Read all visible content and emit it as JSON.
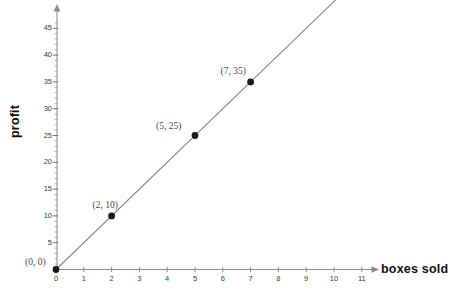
{
  "chart_data": {
    "type": "line",
    "title": "",
    "xlabel": "boxes sold",
    "ylabel": "profit",
    "xlim": [
      0,
      11.8
    ],
    "ylim": [
      0,
      46.5
    ],
    "grid": false,
    "legend": null,
    "x_ticks": [
      "0",
      "1",
      "2",
      "3",
      "4",
      "5",
      "6",
      "7",
      "8",
      "9",
      "10",
      "11"
    ],
    "x_tick_values": [
      0,
      1,
      2,
      3,
      4,
      5,
      6,
      7,
      8,
      9,
      10,
      11
    ],
    "y_ticks": [
      "5",
      "10",
      "15",
      "20",
      "25",
      "30",
      "35",
      "40",
      "45"
    ],
    "y_tick_values": [
      5,
      10,
      15,
      20,
      25,
      30,
      35,
      40,
      45
    ],
    "y_minor_step": 1,
    "series": [
      {
        "name": "profit line",
        "color": "#8a8a8a",
        "x": [
          0,
          11.5
        ],
        "y": [
          0,
          57.5
        ],
        "slope": 5,
        "intercept": 0
      }
    ],
    "points": [
      {
        "x": 0,
        "y": 0,
        "label": "(0, 0)",
        "label_dx": -31,
        "label_dy": -13
      },
      {
        "x": 2,
        "y": 10,
        "label": "(2, 10)",
        "label_dx": -19,
        "label_dy": -16
      },
      {
        "x": 5,
        "y": 25,
        "label": "(5, 25)",
        "label_dx": -39,
        "label_dy": -15
      },
      {
        "x": 7,
        "y": 35,
        "label": "(7, 35)",
        "label_dx": -30,
        "label_dy": -16
      }
    ],
    "point_color": "#1a1a1a",
    "axis_color": "#8a8a8a"
  },
  "axes": {
    "x_title": "boxes sold",
    "y_title": "profit"
  }
}
